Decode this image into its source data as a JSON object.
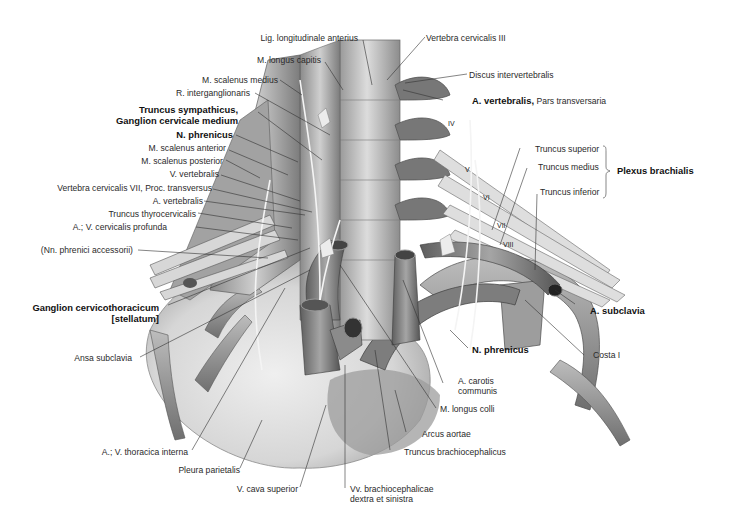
{
  "figure": {
    "colors": {
      "background": "#ffffff",
      "ink": "#2a2a2a",
      "tissue_light": "#e6e6e6",
      "tissue_mid": "#b9b9b9",
      "tissue_dark": "#6e6e6e",
      "leader": "#333333"
    }
  },
  "labels": {
    "lig_longitudinale": "Lig. longitudinale anterius",
    "vertebra_c3": "Vertebra cervicalis III",
    "m_longus_capitis": "M. longus capitis",
    "discus": "Discus intervertebralis",
    "m_scalenus_medius": "M. scalenus medius",
    "a_vertebralis_pars_bold": "A. vertebralis,",
    "a_vertebralis_pars_plain": " Pars transversaria",
    "r_interganglionaris": "R. interganglionaris",
    "truncus_sympathicus": "Truncus sympathicus,\nGanglion cervicale medium",
    "n_phrenicus_left": "N. phrenicus",
    "m_scalenus_anterior": "M. scalenus anterior",
    "m_scalenus_posterior": "M. scalenus posterior",
    "v_vertebralis": "V. vertebralis",
    "vertebra_c7": "Vertebra cervicalis VII, Proc. transversus",
    "a_vertebralis": "A. vertebralis",
    "truncus_thyrocervicalis": "Truncus thyrocervicalis",
    "cervicalis_profunda": "A.; V. cervicalis profunda",
    "nn_phrenici_accessorii": "(Nn. phrenici accessorii)",
    "ganglion_stellatum": "Ganglion cervicothoracicum\n[stellatum]",
    "ansa_subclavia": "Ansa subclavia",
    "thoracica_interna": "A.; V. thoracica interna",
    "pleura_parietalis": "Pleura parietalis",
    "v_cava_superior": "V. cava superior",
    "vv_brachiocephalicae": "Vv. brachiocephalicae\ndextra et sinistra",
    "truncus_brachiocephalicus": "Truncus brachiocephalicus",
    "arcus_aortae": "Arcus aortae",
    "m_longus_colli": "M. longus colli",
    "a_carotis_communis": "A. carotis\ncommunis",
    "n_phrenicus_right": "N. phrenicus",
    "costa_1": "Costa I",
    "a_subclavia": "A. subclavia",
    "truncus_superior": "Truncus superior",
    "truncus_medius": "Truncus medius",
    "truncus_inferior": "Truncus inferior",
    "plexus_brachialis": "Plexus brachialis"
  },
  "spinal_nerve_numerals": [
    "IV",
    "V",
    "VI",
    "VII",
    "VIII"
  ]
}
